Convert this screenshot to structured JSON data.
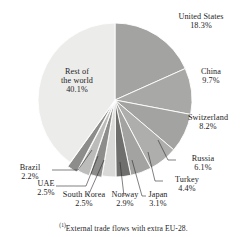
{
  "figure": {
    "title": "",
    "footnote_marker": "(1)",
    "footnote_text": "External trade flows with extra EU-28."
  },
  "chart_data": {
    "type": "pie",
    "title": "",
    "subtitle": "",
    "xlabel": "",
    "ylabel": "",
    "legend_position": "none",
    "grid": false,
    "value_unit": "%",
    "start_angle_deg": 0,
    "direction": "clockwise",
    "center_px": [
      115,
      100
    ],
    "radius_px": 77,
    "categories": [
      "United States",
      "China",
      "Switzerland",
      "Russia",
      "Turkey",
      "Japan",
      "Norway",
      "South Korea",
      "UAE",
      "Brazil",
      "Rest of the world"
    ],
    "values": [
      18.3,
      9.7,
      8.2,
      6.1,
      4.4,
      3.1,
      2.9,
      2.5,
      2.5,
      2.2,
      40.1
    ],
    "slice_colors": [
      "#a3a3a1",
      "#a8a8a6",
      "#a3a3a1",
      "#aeaeac",
      "#a3a3a1",
      "#6f6f6d",
      "#d9d9d7",
      "#8d8d8b",
      "#bcbcba",
      "#8d8d8b",
      "#ececeb"
    ],
    "separator_color": "#ffffff",
    "slices": [
      {
        "label": "United States",
        "value": 18.3,
        "value_label": "18.3%"
      },
      {
        "label": "China",
        "value": 9.7,
        "value_label": "9.7%"
      },
      {
        "label": "Switzerland",
        "value": 8.2,
        "value_label": "8.2%"
      },
      {
        "label": "Russia",
        "value": 6.1,
        "value_label": "6.1%"
      },
      {
        "label": "Turkey",
        "value": 4.4,
        "value_label": "4.4%"
      },
      {
        "label": "Japan",
        "value": 3.1,
        "value_label": "3.1%"
      },
      {
        "label": "Norway",
        "value": 2.9,
        "value_label": "2.9%"
      },
      {
        "label": "South Korea",
        "value": 2.5,
        "value_label": "2.5%"
      },
      {
        "label": "UAE",
        "value": 2.5,
        "value_label": "2.5%"
      },
      {
        "label": "Brazil",
        "value": 2.2,
        "value_label": "2.2%"
      },
      {
        "label": "Rest of the world",
        "value": 40.1,
        "value_label": "40.1%"
      }
    ]
  },
  "labels": {
    "united_states": {
      "name": "United States",
      "pct": "18.3%"
    },
    "china": {
      "name": "China",
      "pct": "9.7%"
    },
    "switzerland": {
      "name": "Switzerland",
      "pct": "8.2%"
    },
    "russia": {
      "name": "Russia",
      "pct": "6.1%"
    },
    "turkey": {
      "name": "Turkey",
      "pct": "4.4%"
    },
    "japan": {
      "name": "Japan",
      "pct": "3.1%"
    },
    "norway": {
      "name": "Norway",
      "pct": "2.9%"
    },
    "south_korea": {
      "name": "South Korea",
      "pct": "2.5%"
    },
    "uae": {
      "name": "UAE",
      "pct": "2.5%"
    },
    "brazil": {
      "name": "Brazil",
      "pct": "2.2%"
    },
    "rest_of_world": {
      "name1": "Rest of",
      "name2": "the world",
      "pct": "40.1%"
    }
  }
}
